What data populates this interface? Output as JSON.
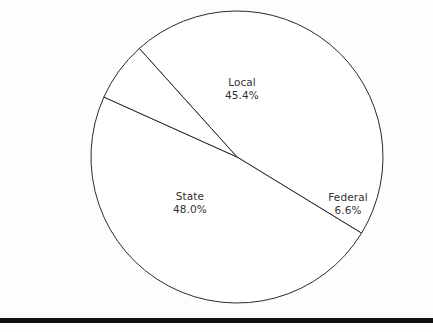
{
  "background_color": "#fdfdfb",
  "outline_color": "#2a2a2a",
  "text_color": "#33312f",
  "rule_color": "#111111",
  "chart_data": {
    "type": "pie",
    "title": "",
    "subtitle": "",
    "xlabel": "",
    "ylabel": "",
    "grid": false,
    "legend_position": "none",
    "labels_position": "inside-slice",
    "categories": [
      "Local",
      "State",
      "Federal"
    ],
    "values": [
      45.4,
      48.0,
      6.6
    ],
    "value_suffix": "%",
    "slices": [
      {
        "label": "Local",
        "value": 45.4,
        "value_text": "45.4%",
        "fill": "#ffffff",
        "stroke": "#2a2a2a"
      },
      {
        "label": "State",
        "value": 48.0,
        "value_text": "48.0%",
        "fill": "#ffffff",
        "stroke": "#2a2a2a"
      },
      {
        "label": "Federal",
        "value": 6.6,
        "value_text": "6.6%",
        "fill": "#ffffff",
        "stroke": "#2a2a2a"
      }
    ],
    "geometry": {
      "center_x": 237,
      "center_y": 157,
      "radius": 146,
      "start_angle_deg": -132.0
    }
  },
  "labels": {
    "local": {
      "name": "Local",
      "value": "45.4%"
    },
    "state": {
      "name": "State",
      "value": "48.0%"
    },
    "federal": {
      "name": "Federal",
      "value": "6.6%"
    }
  },
  "footer_rule": {
    "present": true
  }
}
